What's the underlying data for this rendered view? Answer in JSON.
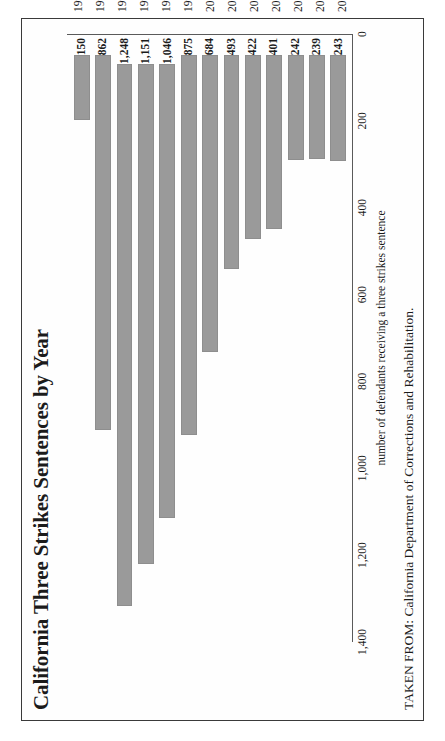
{
  "figure": {
    "title": "California Three Strikes Sentences by Year",
    "source_note": "TAKEN FROM: California Department of Corrections and Rehabilitation."
  },
  "chart_data": {
    "type": "bar",
    "title": "California Three Strikes Sentences by Year",
    "xlabel": "",
    "ylabel": "number of defendants receiving a three strikes sentence",
    "categories": [
      "1994",
      "1995",
      "1996",
      "1997",
      "1998",
      "1999",
      "2000",
      "2001",
      "2002",
      "2003",
      "2004",
      "2005",
      "2006"
    ],
    "values": [
      150,
      862,
      1248,
      1151,
      1046,
      875,
      684,
      493,
      422,
      401,
      242,
      239,
      243
    ],
    "value_labels": [
      "150",
      "862",
      "1,248",
      "1,151",
      "1,046",
      "875",
      "684",
      "493",
      "422",
      "401",
      "242",
      "239",
      "243"
    ],
    "ylim": [
      0,
      1400
    ],
    "yticks": [
      0,
      200,
      400,
      600,
      800,
      1000,
      1200,
      1400
    ],
    "ytick_labels": [
      "0",
      "200",
      "400",
      "600",
      "800",
      "1,000",
      "1,200",
      "1,400"
    ],
    "grid": false,
    "legend": null,
    "orientation": "vertical",
    "bar_color": "#9a9a9a",
    "rotation_note": "page rendered rotated 90 degrees counter-clockwise"
  }
}
